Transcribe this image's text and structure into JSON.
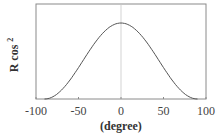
{
  "chart_data": {
    "type": "line",
    "title": "",
    "xlabel": "(degree)",
    "ylabel": "R cos",
    "ylabel_superscript": "2",
    "xlim": [
      -100,
      100
    ],
    "ylim": [
      0,
      1.25
    ],
    "x_ticks": [
      -100,
      -50,
      0,
      50,
      100
    ],
    "x_tick_labels": [
      "-100",
      "-50",
      "0",
      "50",
      "100"
    ],
    "y_ticks": [],
    "grid": false,
    "legend": null,
    "reference_line_x": 0,
    "series": [
      {
        "name": "R cos^2",
        "x": [
          -90,
          -80,
          -70,
          -60,
          -50,
          -40,
          -30,
          -20,
          -10,
          0,
          10,
          20,
          30,
          40,
          50,
          60,
          70,
          80,
          90
        ],
        "y": [
          0.0,
          0.03,
          0.12,
          0.25,
          0.41,
          0.59,
          0.75,
          0.88,
          0.97,
          1.0,
          0.97,
          0.88,
          0.75,
          0.59,
          0.41,
          0.25,
          0.12,
          0.03,
          0.0
        ]
      }
    ],
    "colors": {
      "line": "#555555",
      "axis": "#888888",
      "zero_line": "#bbbbbb"
    }
  }
}
